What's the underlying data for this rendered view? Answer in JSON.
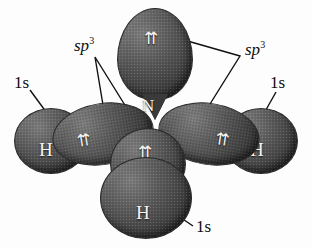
{
  "figure": {
    "background_color": "#fdfdfd",
    "orbital_color": "#4a4a4a",
    "label_color": "#0d0d0d",
    "atom_label_color": "#f4f4f4"
  },
  "center_atom": {
    "symbol": "N"
  },
  "electron_pairs": {
    "glyph": "⇈",
    "lone_pair_top": "⇈",
    "bond_left": "⇈",
    "bond_right": "⇈",
    "bond_bottom": "⇈"
  },
  "hydrogens": [
    {
      "symbol": "H",
      "position": "left"
    },
    {
      "symbol": "H",
      "position": "right"
    },
    {
      "symbol": "H",
      "position": "bottom"
    }
  ],
  "labels": {
    "sp3_left": {
      "base": "sp",
      "exponent": "3"
    },
    "sp3_right": {
      "base": "sp",
      "exponent": "3"
    },
    "one_s_left": "1s",
    "one_s_right": "1s",
    "one_s_bottom": "1s"
  }
}
